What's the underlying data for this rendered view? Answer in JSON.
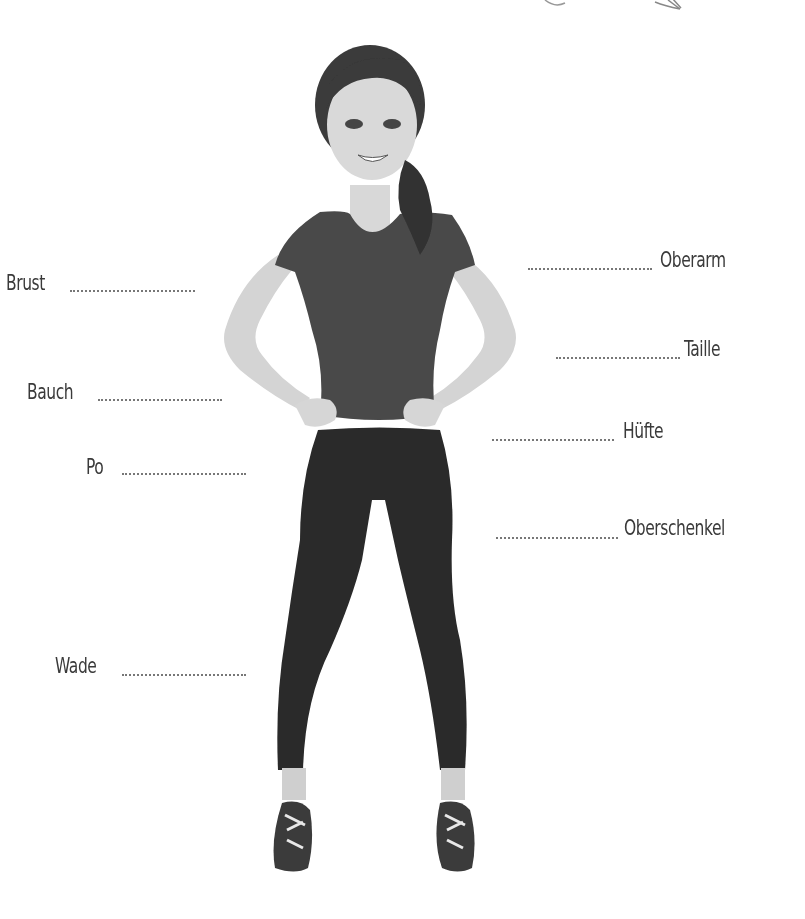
{
  "diagram": {
    "labels": {
      "left": [
        {
          "id": "brust",
          "text": "Brust"
        },
        {
          "id": "bauch",
          "text": "Bauch"
        },
        {
          "id": "po",
          "text": "Po"
        },
        {
          "id": "wade",
          "text": "Wade"
        }
      ],
      "right": [
        {
          "id": "oberarm",
          "text": "Oberarm"
        },
        {
          "id": "taille",
          "text": "Taille"
        },
        {
          "id": "huefte",
          "text": "Hüfte"
        },
        {
          "id": "oberschenkel",
          "text": "Oberschenkel"
        }
      ]
    },
    "colors": {
      "shirt": "#4a4a4a",
      "leggings": "#2a2a2a",
      "skin": "#d6d6d6",
      "hair": "#3a3a3a",
      "text": "#3a3a3a",
      "dots": "#777777"
    }
  }
}
